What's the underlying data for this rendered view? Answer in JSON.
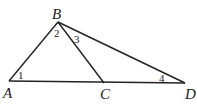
{
  "diagram": {
    "points": {
      "A": {
        "label": "A",
        "x": 9,
        "y": 81
      },
      "B": {
        "label": "B",
        "x": 58,
        "y": 22
      },
      "C": {
        "label": "C",
        "x": 104,
        "y": 83
      },
      "D": {
        "label": "D",
        "x": 185,
        "y": 83
      }
    },
    "segments": [
      "AB",
      "BC",
      "BD",
      "AD"
    ],
    "angles": [
      {
        "label": "1",
        "vertex": "A"
      },
      {
        "label": "2",
        "vertex": "B"
      },
      {
        "label": "3",
        "vertex": "B"
      },
      {
        "label": "4",
        "vertex": "D"
      }
    ]
  }
}
